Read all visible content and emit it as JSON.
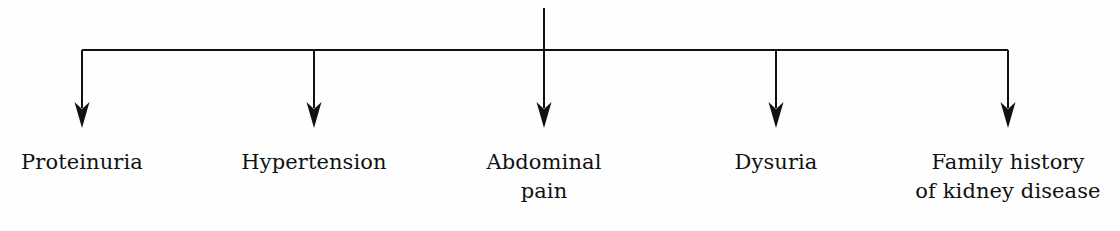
{
  "diagram": {
    "type": "flowchart-fanout",
    "orientation": "top-down",
    "background_color": "#fefefe",
    "line_color": "#111111",
    "text_color": "#111111",
    "stem": {
      "name": "root-stem",
      "x": 544,
      "y_top": 8,
      "y_bottom": 50
    },
    "bus": {
      "name": "horizontal-connector",
      "y": 50,
      "x_start": 82,
      "x_end": 1008
    },
    "arrow_tip_y": 128,
    "branches": [
      {
        "id": "branch-1",
        "x": 82,
        "lines": [
          "Proteinuria"
        ]
      },
      {
        "id": "branch-2",
        "x": 314,
        "lines": [
          "Hypertension"
        ]
      },
      {
        "id": "branch-3",
        "x": 544,
        "lines": [
          "Abdominal",
          "pain"
        ]
      },
      {
        "id": "branch-4",
        "x": 776,
        "lines": [
          "Dysuria"
        ]
      },
      {
        "id": "branch-5",
        "x": 1008,
        "lines": [
          "Family history",
          "of kidney disease"
        ]
      }
    ]
  }
}
